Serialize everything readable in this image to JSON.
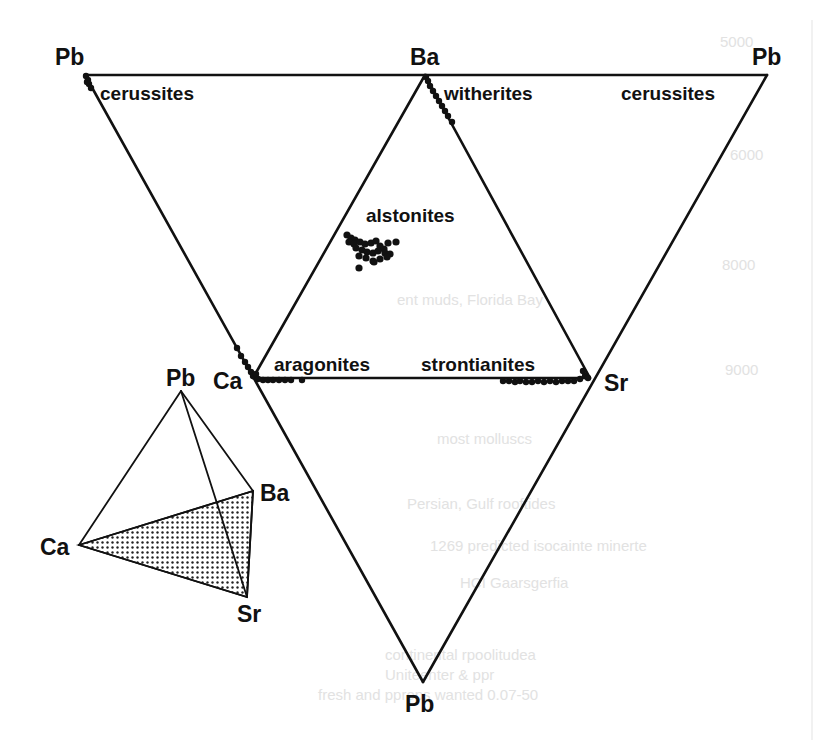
{
  "figure": {
    "line_color": "#111111",
    "point_color": "#111111",
    "background": "#ffffff"
  },
  "unfolded_net": {
    "vertices": {
      "pb_top_left": {
        "label": "Pb",
        "x": 85,
        "y": 75
      },
      "ba_top": {
        "label": "Ba",
        "x": 425,
        "y": 75
      },
      "pb_top_right": {
        "label": "Pb",
        "x": 767,
        "y": 75
      },
      "ca": {
        "label": "Ca",
        "x": 253,
        "y": 378
      },
      "sr": {
        "label": "Sr",
        "x": 590,
        "y": 378
      },
      "pb_bottom": {
        "label": "Pb",
        "x": 423,
        "y": 682
      }
    },
    "faces": [
      {
        "name": "Pb-Ba-Ca",
        "vertices": [
          "pb_top_left",
          "ba_top",
          "ca"
        ]
      },
      {
        "name": "Ba-Ca-Sr",
        "vertices": [
          "ba_top",
          "ca",
          "sr"
        ]
      },
      {
        "name": "Ba-Pb-Sr",
        "vertices": [
          "ba_top",
          "pb_top_right",
          "sr"
        ]
      },
      {
        "name": "Ca-Sr-Pb",
        "vertices": [
          "ca",
          "sr",
          "pb_bottom"
        ]
      }
    ]
  },
  "mineral_labels": [
    {
      "id": "cerussites_left",
      "text": "cerussites",
      "x": 100,
      "y": 83
    },
    {
      "id": "witherites",
      "text": "witherites",
      "x": 444,
      "y": 83
    },
    {
      "id": "cerussites_right",
      "text": "cerussites",
      "x": 621,
      "y": 83
    },
    {
      "id": "alstonites",
      "text": "alstonites",
      "x": 365,
      "y": 205
    },
    {
      "id": "aragonites",
      "text": "aragonites",
      "x": 274,
      "y": 354
    },
    {
      "id": "strontianites",
      "text": "strontianites",
      "x": 422,
      "y": 354
    }
  ],
  "vertex_labels": [
    {
      "id": "pb_tl",
      "text": "Pb",
      "x": 55,
      "y": 46
    },
    {
      "id": "ba_top",
      "text": "Ba",
      "x": 410,
      "y": 46
    },
    {
      "id": "pb_tr",
      "text": "Pb",
      "x": 752,
      "y": 46
    },
    {
      "id": "ca_main",
      "text": "Ca",
      "x": 213,
      "y": 370
    },
    {
      "id": "sr_main",
      "text": "Sr",
      "x": 604,
      "y": 372
    },
    {
      "id": "pb_bottom",
      "text": "Pb",
      "x": 405,
      "y": 693
    }
  ],
  "data_points": {
    "cerussites": [
      [
        86,
        76
      ],
      [
        88,
        80
      ],
      [
        89,
        84
      ],
      [
        91,
        88
      ],
      [
        87,
        82
      ]
    ],
    "witherites": [
      [
        426,
        77
      ],
      [
        428,
        81
      ],
      [
        430,
        86
      ],
      [
        433,
        91
      ],
      [
        436,
        96
      ],
      [
        439,
        101
      ],
      [
        442,
        106
      ],
      [
        445,
        111
      ],
      [
        448,
        116
      ],
      [
        452,
        122
      ]
    ],
    "alstonites": [
      [
        347,
        235
      ],
      [
        351,
        238
      ],
      [
        355,
        240
      ],
      [
        349,
        242
      ],
      [
        354,
        244
      ],
      [
        360,
        242
      ],
      [
        365,
        244
      ],
      [
        371,
        243
      ],
      [
        376,
        241
      ],
      [
        380,
        246
      ],
      [
        384,
        249
      ],
      [
        388,
        243
      ],
      [
        396,
        242
      ],
      [
        356,
        248
      ],
      [
        362,
        250
      ],
      [
        367,
        252
      ],
      [
        373,
        253
      ],
      [
        378,
        251
      ],
      [
        385,
        253
      ],
      [
        390,
        254
      ],
      [
        359,
        256
      ],
      [
        366,
        258
      ],
      [
        373,
        261
      ],
      [
        380,
        259
      ],
      [
        387,
        257
      ],
      [
        359,
        268
      ],
      [
        374,
        262
      ]
    ],
    "ca_pb_edge": [
      [
        237,
        348
      ],
      [
        241,
        356
      ],
      [
        245,
        362
      ],
      [
        248,
        367
      ],
      [
        251,
        372
      ],
      [
        253,
        376
      ],
      [
        256,
        374
      ]
    ],
    "aragonites": [
      [
        258,
        379
      ],
      [
        263,
        380
      ],
      [
        268,
        380
      ],
      [
        273,
        380
      ],
      [
        279,
        380
      ],
      [
        285,
        380
      ],
      [
        291,
        380
      ],
      [
        302,
        380
      ]
    ],
    "strontianites": [
      [
        503,
        381
      ],
      [
        509,
        381
      ],
      [
        515,
        382
      ],
      [
        520,
        381
      ],
      [
        526,
        382
      ],
      [
        532,
        382
      ],
      [
        538,
        381
      ],
      [
        544,
        382
      ],
      [
        550,
        381
      ],
      [
        556,
        382
      ],
      [
        562,
        381
      ],
      [
        568,
        381
      ],
      [
        574,
        381
      ],
      [
        580,
        379
      ],
      [
        585,
        376
      ],
      [
        583,
        371
      ],
      [
        588,
        378
      ]
    ]
  },
  "inset_tetrahedron": {
    "vertices": {
      "pb": {
        "label": "Pb",
        "x": 181,
        "y": 391
      },
      "ba": {
        "label": "Ba",
        "x": 253,
        "y": 491
      },
      "ca": {
        "label": "Ca",
        "x": 79,
        "y": 545
      },
      "sr": {
        "label": "Sr",
        "x": 247,
        "y": 597
      }
    },
    "shaded_face": [
      "ca",
      "ba",
      "sr"
    ],
    "labels": [
      {
        "id": "inset_pb",
        "text": "Pb",
        "x": 166,
        "y": 367
      },
      {
        "id": "inset_ba",
        "text": "Ba",
        "x": 260,
        "y": 482
      },
      {
        "id": "inset_ca",
        "text": "Ca",
        "x": 40,
        "y": 536
      },
      {
        "id": "inset_sr",
        "text": "Sr",
        "x": 237,
        "y": 603
      }
    ]
  },
  "bleed_through_text": [
    {
      "text": "ent muds, Florida Bay",
      "x": 397,
      "y": 305
    },
    {
      "text": "most molluscs",
      "x": 437,
      "y": 444
    },
    {
      "text": "Persian, Gulf rooftides",
      "x": 407,
      "y": 509
    },
    {
      "text": "1269 predicted isocainte minerte",
      "x": 430,
      "y": 551
    },
    {
      "text": "HCI Gaarsgerfia",
      "x": 460,
      "y": 588
    },
    {
      "text": "continental rpoolitudea",
      "x": 385,
      "y": 660
    },
    {
      "text": "Uniteenter & ppr",
      "x": 385,
      "y": 680
    },
    {
      "text": "fresh and pprops wanted 0.07-50",
      "x": 318,
      "y": 700
    },
    {
      "text": "5000",
      "x": 720,
      "y": 47
    },
    {
      "text": "6000",
      "x": 730,
      "y": 160
    },
    {
      "text": "8000",
      "x": 722,
      "y": 270
    },
    {
      "text": "9000",
      "x": 725,
      "y": 375
    }
  ]
}
